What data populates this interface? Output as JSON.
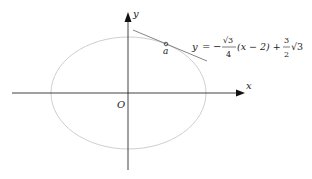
{
  "figure": {
    "type": "ellipse-with-tangent-line",
    "axes": {
      "x_label": "x",
      "y_label": "y",
      "origin_label": "O"
    },
    "point": {
      "label": "a"
    },
    "tangent_equation": {
      "lhs": "y",
      "equals": "=",
      "minus": "−",
      "frac1_num": "√3",
      "frac1_den": "4",
      "middle": "(x − 2) +",
      "frac2_num": "3",
      "frac2_den": "2",
      "tail": "√3",
      "full_text": "y = −(√3/4)(x − 2) + (3/2)√3"
    },
    "colors": {
      "axis": "#111111",
      "ellipse": "#cccccc",
      "tangent": "#666666"
    }
  }
}
